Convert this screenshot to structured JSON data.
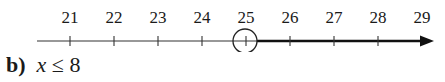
{
  "chart_data": {
    "type": "number_line",
    "ticks": [
      21,
      22,
      23,
      24,
      25,
      26,
      27,
      28,
      29
    ],
    "open_circle_at": 25,
    "shaded_direction": "right",
    "inequality": "x > 25",
    "arrow": "right"
  },
  "next_part": {
    "label": "b)",
    "variable": "x",
    "relation": "≤",
    "value": "8"
  }
}
